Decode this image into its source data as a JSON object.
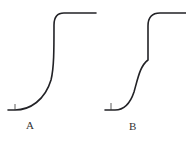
{
  "diagram": {
    "panels": [
      {
        "id": "A",
        "label": "A",
        "shape": "single-step sigmoid curve (concave up rise, sharp vertical, flat plateau)"
      },
      {
        "id": "B",
        "label": "B",
        "shape": "two-step curve (gradual sigmoid rise to midpoint, then sharp vertical step to plateau)"
      }
    ],
    "line_color": "#222226"
  }
}
